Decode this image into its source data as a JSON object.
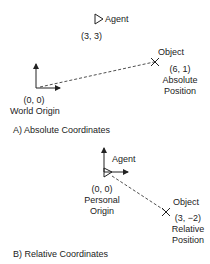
{
  "panel_a": {
    "agent_label": "Agent",
    "agent_coords": "(3, 3)",
    "object_label": "Object",
    "object_coords": "(6, 1)",
    "object_desc_1": "Absolute",
    "object_desc_2": "Position",
    "origin_coords": "(0, 0)",
    "origin_label": "World Origin",
    "caption": "A) Absolute Coordinates"
  },
  "panel_b": {
    "agent_label": "Agent",
    "origin_coords": "(0, 0)",
    "origin_label_1": "Personal",
    "origin_label_2": "Origin",
    "object_label": "Object",
    "object_coords": "(3, −2)",
    "object_desc_1": "Relative",
    "object_desc_2": "Position",
    "caption": "B) Relative Coordinates"
  }
}
